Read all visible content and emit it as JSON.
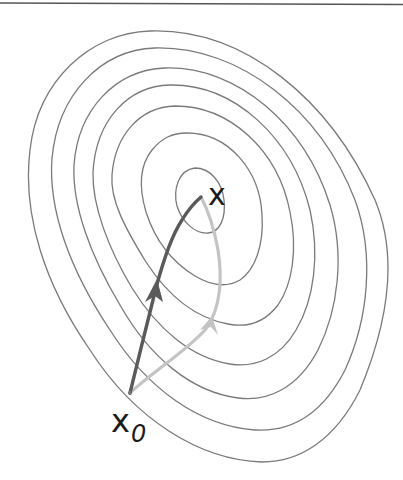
{
  "diagram": {
    "title": "",
    "labels": {
      "optimum": "x",
      "start_base": "x",
      "start_subscript": "0"
    },
    "colors": {
      "background": "#ffffff",
      "top_rule": "#555555",
      "contour": "#7a7a7a",
      "path_dark": "#5a5a5a",
      "path_light": "#c4c4c4",
      "text": "#1a1a1a"
    },
    "contour_count": 7,
    "paths": [
      {
        "name": "direct-path",
        "shade": "dark",
        "from": "x0",
        "to": "x"
      },
      {
        "name": "curved-path",
        "shade": "light",
        "from": "x0",
        "to": "x"
      }
    ]
  }
}
